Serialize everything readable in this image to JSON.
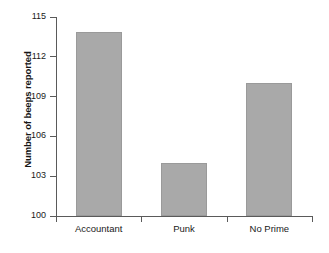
{
  "chart_data": {
    "type": "bar",
    "title": "",
    "xlabel": "",
    "ylabel": "Number of beeps reported",
    "categories": [
      "Accountant",
      "Punk",
      "No Prime"
    ],
    "values": [
      113.9,
      104.0,
      110.0
    ],
    "ylim": [
      100,
      115
    ],
    "ytick_labels": [
      "100",
      "103",
      "106",
      "109",
      "112",
      "115"
    ],
    "ytick_values": [
      100,
      103,
      106,
      109,
      112,
      115
    ],
    "grid": false,
    "legend": null,
    "bar_color": "#a9a9a9",
    "axis_color": "#5a5a5a"
  }
}
